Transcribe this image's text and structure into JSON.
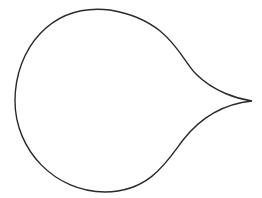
{
  "figure": {
    "shape": "teardrop-outline",
    "stroke_color": "#2a2a2a",
    "background": "#ffffff"
  }
}
